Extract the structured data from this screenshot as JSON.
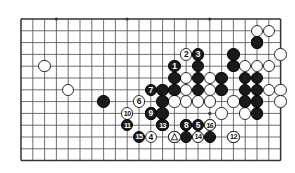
{
  "diagram": {
    "type": "go-board-problem",
    "board": {
      "columns": 23,
      "rows": 13,
      "left_px": 21,
      "top_px": 19,
      "spacing_px": 11.8,
      "line_color": "#555555",
      "edge_color": "#333333",
      "background": "#ffffff",
      "star_points": [
        {
          "col": 3,
          "row": 0
        },
        {
          "col": 9,
          "row": 0
        },
        {
          "col": 16,
          "row": 0
        },
        {
          "col": 16,
          "row": 8
        }
      ]
    },
    "stones": {
      "black": [
        {
          "col": 20,
          "row": 2
        },
        {
          "col": 18,
          "row": 3
        },
        {
          "col": 18,
          "row": 4
        },
        {
          "col": 15,
          "row": 4
        },
        {
          "col": 13,
          "row": 5
        },
        {
          "col": 15,
          "row": 5
        },
        {
          "col": 17,
          "row": 5
        },
        {
          "col": 19,
          "row": 5
        },
        {
          "col": 20,
          "row": 5
        },
        {
          "col": 13,
          "row": 6
        },
        {
          "col": 12,
          "row": 6
        },
        {
          "col": 15,
          "row": 6
        },
        {
          "col": 17,
          "row": 6
        },
        {
          "col": 19,
          "row": 6
        },
        {
          "col": 20,
          "row": 6
        },
        {
          "col": 7,
          "row": 7
        },
        {
          "col": 12,
          "row": 7
        },
        {
          "col": 19,
          "row": 7
        },
        {
          "col": 20,
          "row": 7
        },
        {
          "col": 11,
          "row": 8
        },
        {
          "col": 12,
          "row": 8
        },
        {
          "col": 20,
          "row": 8
        },
        {
          "col": 12,
          "row": 9
        },
        {
          "col": 14,
          "row": 9
        },
        {
          "col": 16,
          "row": 9
        },
        {
          "col": 13,
          "row": 10
        },
        {
          "col": 14,
          "row": 10
        },
        {
          "col": 16,
          "row": 10
        }
      ],
      "white": [
        {
          "col": 20,
          "row": 1
        },
        {
          "col": 21,
          "row": 1
        },
        {
          "col": 20,
          "row": 2,
          "note": "upper-left-of-pair"
        },
        {
          "col": 22,
          "row": 3
        },
        {
          "col": 19,
          "row": 4
        },
        {
          "col": 20,
          "row": 4
        },
        {
          "col": 21,
          "row": 4
        },
        {
          "col": 2,
          "row": 4
        },
        {
          "col": 4,
          "row": 6
        },
        {
          "col": 14,
          "row": 5
        },
        {
          "col": 16,
          "row": 5
        },
        {
          "col": 22,
          "row": 6
        },
        {
          "col": 14,
          "row": 6
        },
        {
          "col": 16,
          "row": 6
        },
        {
          "col": 21,
          "row": 6
        },
        {
          "col": 13,
          "row": 7
        },
        {
          "col": 14,
          "row": 7
        },
        {
          "col": 15,
          "row": 7
        },
        {
          "col": 16,
          "row": 7
        },
        {
          "col": 18,
          "row": 7
        },
        {
          "col": 22,
          "row": 7
        },
        {
          "col": 17,
          "row": 8
        },
        {
          "col": 19,
          "row": 8
        },
        {
          "col": 15,
          "row": 10
        },
        {
          "col": 18,
          "row": 10
        }
      ]
    },
    "move_markers": [
      {
        "label": "1",
        "color": "black",
        "col": 13,
        "row": 4
      },
      {
        "label": "2",
        "color": "white",
        "col": 14,
        "row": 3
      },
      {
        "label": "3",
        "color": "black",
        "col": 15,
        "row": 3
      },
      {
        "label": "4",
        "color": "white",
        "col": 11,
        "row": 10
      },
      {
        "label": "5",
        "color": "black",
        "col": 15,
        "row": 9
      },
      {
        "label": "6",
        "color": "white",
        "col": 10,
        "row": 7
      },
      {
        "label": "7",
        "color": "black",
        "col": 11,
        "row": 6
      },
      {
        "label": "8",
        "color": "black",
        "col": 14,
        "row": 9
      },
      {
        "label": "9",
        "color": "black",
        "col": 11,
        "row": 8
      },
      {
        "label": "10",
        "color": "white",
        "col": 9,
        "row": 8
      },
      {
        "label": "11",
        "color": "black",
        "col": 9,
        "row": 9
      },
      {
        "label": "12",
        "color": "white",
        "col": 18,
        "row": 10
      },
      {
        "label": "13",
        "color": "black",
        "col": 12,
        "row": 9
      },
      {
        "label": "14",
        "color": "white",
        "col": 15,
        "row": 10
      },
      {
        "label": "15",
        "color": "black",
        "col": 10,
        "row": 10
      },
      {
        "label": "16",
        "color": "white",
        "col": 16,
        "row": 9
      }
    ],
    "marked_stone": {
      "label": "triangle",
      "color": "white",
      "col": 13,
      "row": 10,
      "marker": "△"
    }
  }
}
